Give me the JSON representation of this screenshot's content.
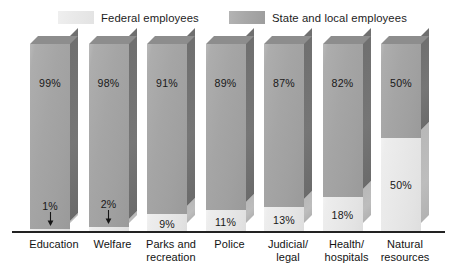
{
  "legend": {
    "entries": [
      {
        "label": "Federal employees",
        "swatch": "federal",
        "color": "#e9e9e9"
      },
      {
        "label": "State and local employees",
        "swatch": "state",
        "color": "#a8a8a8"
      }
    ]
  },
  "axis": {
    "baseline_color": "#222222"
  },
  "chart_data": {
    "type": "bar",
    "title": "",
    "subtitle": "",
    "xlabel": "",
    "ylabel": "",
    "ylim": [
      0,
      100
    ],
    "grid": false,
    "stacked": true,
    "percent": true,
    "legend_position": "top-center",
    "categories": [
      "Education",
      "Welfare",
      "Parks and recreation",
      "Police",
      "Judicial/legal",
      "Health/hospitals",
      "Natural resources"
    ],
    "category_lines": [
      [
        "Education"
      ],
      [
        "Welfare"
      ],
      [
        "Parks and",
        "recreation"
      ],
      [
        "Police"
      ],
      [
        "Judicial/",
        "legal"
      ],
      [
        "Health/",
        "hospitals"
      ],
      [
        "Natural",
        "resources"
      ]
    ],
    "series": [
      {
        "name": "State and local employees",
        "values": [
          99,
          98,
          91,
          89,
          87,
          82,
          50
        ],
        "labels": [
          "99%",
          "98%",
          "91%",
          "89%",
          "87%",
          "82%",
          "50%"
        ],
        "color": "#a8a8a8"
      },
      {
        "name": "Federal employees",
        "values": [
          1,
          2,
          9,
          11,
          13,
          18,
          50
        ],
        "labels": [
          "1%",
          "2%",
          "9%",
          "11%",
          "13%",
          "18%",
          "50%"
        ],
        "color": "#e9e9e9"
      }
    ],
    "annotations": [
      {
        "category": "Education",
        "text": "1%",
        "marker": "down-arrow"
      },
      {
        "category": "Welfare",
        "text": "2%",
        "marker": "down-arrow"
      }
    ]
  }
}
